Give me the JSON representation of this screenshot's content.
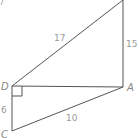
{
  "diagram": {
    "type": "geometry-figure",
    "vertices": {
      "top": {
        "label": "",
        "x": 123,
        "y": 0
      },
      "D": {
        "label": "D",
        "x": 12,
        "y": 86
      },
      "A": {
        "label": "A",
        "x": 123,
        "y": 87
      },
      "C": {
        "label": "C",
        "x": 12,
        "y": 131
      }
    },
    "vertex_labels": {
      "D": "D",
      "A": "A",
      "C": "C"
    },
    "edge_lengths": {
      "D_top": "17",
      "A_top": "15",
      "D_C": "6",
      "C_A": "10"
    },
    "right_angle_at": "D",
    "colors": {
      "line": "#555555",
      "text": "#888888"
    }
  }
}
